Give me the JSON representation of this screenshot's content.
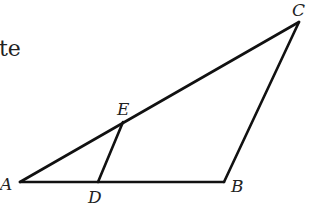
{
  "fragment_text": "te",
  "diagram": {
    "type": "triangle",
    "stroke_color": "#111111",
    "points": {
      "A": {
        "label": "A",
        "x": 20,
        "y": 182
      },
      "B": {
        "label": "B",
        "x": 224,
        "y": 182
      },
      "C": {
        "label": "C",
        "x": 299,
        "y": 22
      },
      "D": {
        "label": "D",
        "x": 98,
        "y": 182
      },
      "E": {
        "label": "E",
        "x": 123,
        "y": 122
      }
    },
    "segments": [
      [
        "A",
        "B"
      ],
      [
        "B",
        "C"
      ],
      [
        "C",
        "A"
      ],
      [
        "D",
        "E"
      ]
    ]
  }
}
